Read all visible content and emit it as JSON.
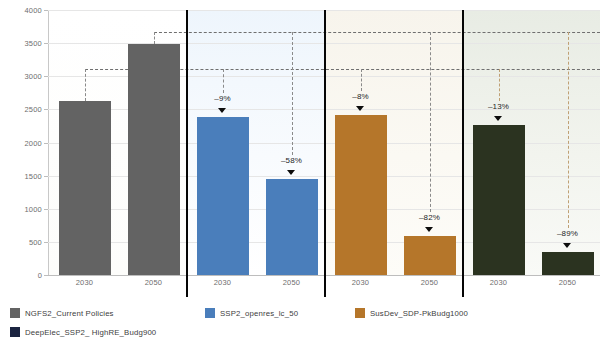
{
  "chart_data": {
    "type": "bar",
    "title": "",
    "xlabel": "",
    "ylabel": "CO2 emissions (direct) MtCO2",
    "ylim": [
      0,
      4000
    ],
    "ytick_step": 500,
    "yticks": [
      "0",
      "500",
      "1000",
      "1500",
      "2000",
      "2500",
      "3000",
      "3500",
      "4000"
    ],
    "grid": true,
    "legend_position": "bottom-left",
    "categories": [
      "2030",
      "2050"
    ],
    "groups": [
      {
        "name": "NGFS2_Current Policies",
        "color": "#636363",
        "values": [
          2620,
          3490
        ],
        "annotations": [
          "",
          ""
        ]
      },
      {
        "name": "SSP2_openres_lc_50",
        "color": "#4a7ebb",
        "values": [
          2380,
          1450
        ],
        "annotations": [
          "–9%",
          "–58%"
        ]
      },
      {
        "name": "SusDev_SDP-PkBudg1000",
        "color": "#b5762a",
        "values": [
          2420,
          590
        ],
        "annotations": [
          "–8%",
          "–82%"
        ]
      },
      {
        "name": "DeepElec_SSP2_ HighRE_Budg900",
        "color": "#2b3320",
        "values": [
          2270,
          350
        ],
        "annotations": [
          "–13%",
          "–89%"
        ]
      }
    ],
    "reference_lines": [
      {
        "value": 3110,
        "from_group": 0,
        "from_bar": 0,
        "style": "dashed",
        "color": "#6f6f6f"
      },
      {
        "value": 3670,
        "from_group": 0,
        "from_bar": 1,
        "style": "dashed",
        "color": "#6f6f6f"
      }
    ]
  },
  "axis": {
    "y_title_main": "CO",
    "y_title_sub1": "2",
    "y_title_mid": " emissions (direct) MtCO",
    "y_title_sub2": "2",
    "tick_0": "0",
    "tick_500": "500",
    "tick_1000": "1000",
    "tick_1500": "1500",
    "tick_2000": "2000",
    "tick_2500": "2500",
    "tick_3000": "3000",
    "tick_3500": "3500",
    "tick_4000": "4000"
  },
  "x_labels": {
    "g0_2030": "2030",
    "g0_2050": "2050",
    "g1_2030": "2030",
    "g1_2050": "2050",
    "g2_2030": "2030",
    "g2_2050": "2050",
    "g3_2030": "2030",
    "g3_2050": "2050"
  },
  "annotations": {
    "blue_2030": "–9%",
    "blue_2050": "–58%",
    "orange_2030": "–8%",
    "orange_2050": "–82%",
    "green_2030": "–13%",
    "green_2050": "–89%"
  },
  "legend": {
    "items": [
      {
        "label": "NGFS2_Current Policies",
        "color": "#636363"
      },
      {
        "label": "SSP2_openres_lc_50",
        "color": "#4a7ebb"
      },
      {
        "label": "SusDev_SDP-PkBudg1000",
        "color": "#b5762a"
      },
      {
        "label": "DeepElec_SSP2_ HighRE_Budg900",
        "color": "#1b2440"
      }
    ]
  }
}
